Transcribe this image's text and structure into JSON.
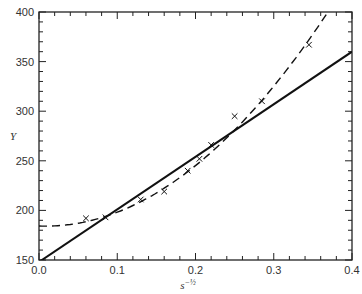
{
  "chart_data": {
    "type": "line",
    "title": "",
    "xlabel": "s^-1/2",
    "ylabel": "Y",
    "xlim": [
      0.0,
      0.4
    ],
    "ylim": [
      150,
      400
    ],
    "grid": false,
    "x_ticks": [
      0.0,
      0.1,
      0.2,
      0.3,
      0.4
    ],
    "x_tick_labels": [
      "0.0",
      "0.1",
      "0.2",
      "0.3",
      "0.4"
    ],
    "y_ticks": [
      150,
      200,
      250,
      300,
      350,
      400
    ],
    "y_tick_labels": [
      "150",
      "200",
      "250",
      "300",
      "350",
      "400"
    ],
    "x_minor_step": 0.02,
    "y_minor_step": 10,
    "series": [
      {
        "name": "linear fit",
        "style": "solid",
        "kind": "line",
        "x": [
          0.0,
          0.4
        ],
        "y": [
          148,
          360
        ]
      },
      {
        "name": "quadratic fit",
        "style": "dashed",
        "kind": "curve",
        "x": [
          0.0,
          0.05,
          0.1,
          0.15,
          0.2,
          0.25,
          0.3,
          0.35,
          0.365
        ],
        "y": [
          183,
          187,
          200,
          219,
          245,
          280,
          323,
          374,
          400
        ]
      },
      {
        "name": "data",
        "style": "marker-x",
        "kind": "scatter",
        "x": [
          0.06,
          0.085,
          0.13,
          0.16,
          0.19,
          0.205,
          0.22,
          0.25,
          0.285,
          0.345
        ],
        "y": [
          192,
          193,
          211,
          219,
          240,
          252,
          266,
          295,
          310,
          367
        ]
      }
    ]
  }
}
